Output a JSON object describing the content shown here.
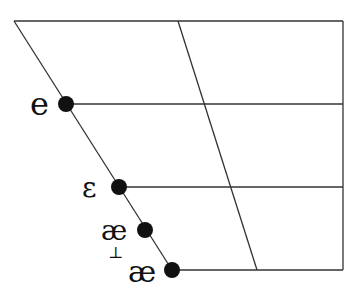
{
  "diagram": {
    "type": "vowel-quadrilateral",
    "colors": {
      "line": "#333333",
      "dot": "#111111",
      "background": "#ffffff"
    },
    "vowels": [
      {
        "symbol": "e",
        "label": "e"
      },
      {
        "symbol": "ɛ",
        "label": "ε"
      },
      {
        "symbol": "æ̝",
        "label": "æ",
        "diacritic": "⊥"
      },
      {
        "symbol": "æ",
        "label": "æ"
      }
    ]
  }
}
